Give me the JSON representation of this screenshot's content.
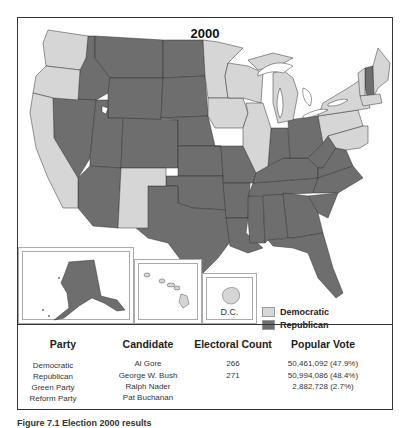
{
  "map": {
    "title": "2000",
    "legend": [
      {
        "label": "Democratic",
        "color": "#d6d6d6"
      },
      {
        "label": "Republican",
        "color": "#6e6e6e"
      }
    ],
    "insets": {
      "dc_label": "D.C."
    },
    "states_democratic": [
      "WA",
      "OR",
      "CA",
      "NM",
      "MN",
      "WI",
      "IA",
      "IL",
      "MI",
      "PA",
      "NY",
      "VT",
      "ME",
      "MA",
      "RI",
      "CT",
      "NJ",
      "DE",
      "MD",
      "DC",
      "HI"
    ],
    "states_republican": [
      "ID",
      "MT",
      "WY",
      "NV",
      "UT",
      "CO",
      "AZ",
      "ND",
      "SD",
      "NE",
      "KS",
      "OK",
      "TX",
      "MO",
      "AR",
      "LA",
      "MS",
      "AL",
      "TN",
      "KY",
      "IN",
      "OH",
      "WV",
      "VA",
      "NC",
      "SC",
      "GA",
      "FL",
      "NH",
      "AK"
    ]
  },
  "table": {
    "headers": [
      "Party",
      "Candidate",
      "Electoral Count",
      "Popular Vote"
    ],
    "rows": [
      {
        "party": "Democratic",
        "candidate": "Al Gore",
        "electoral": "266",
        "popular": "50,461,092 (47.9%)"
      },
      {
        "party": "Republican",
        "candidate": "George W. Bush",
        "electoral": "271",
        "popular": "50,994,086 (48.4%)"
      },
      {
        "party": "Green Party",
        "candidate": "Ralph Nader",
        "electoral": "",
        "popular": "2,882,728 (2.7%)"
      },
      {
        "party": "Reform Party",
        "candidate": "Pat Buchanan",
        "electoral": "",
        "popular": ""
      }
    ]
  },
  "caption": "Figure 7.1 Election 2000 results"
}
